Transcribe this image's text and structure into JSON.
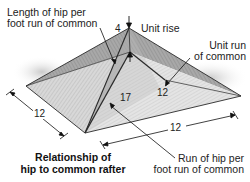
{
  "figure": {
    "caption": {
      "line1": "Relationship of",
      "line2": "hip to common rafter"
    },
    "callouts": {
      "length_of_hip": {
        "line1": "Length of hip per",
        "line2": "foot run of common"
      },
      "unit_rise": "Unit rise",
      "unit_run": {
        "line1": "Unit run",
        "line2": "of common"
      },
      "run_of_hip": {
        "line1": "Run of hip per",
        "line2": "foot run of common"
      }
    },
    "measurements": {
      "rise": "4",
      "hip_run": "17",
      "common_run": "12",
      "left_side": "12",
      "front_side": "12"
    },
    "colors": {
      "roof_light": "#cfcfcf",
      "roof_mid": "#a9a9a9",
      "roof_dark": "#7d7d7d",
      "line": "#2a2a2a",
      "background": "#ffffff"
    }
  }
}
